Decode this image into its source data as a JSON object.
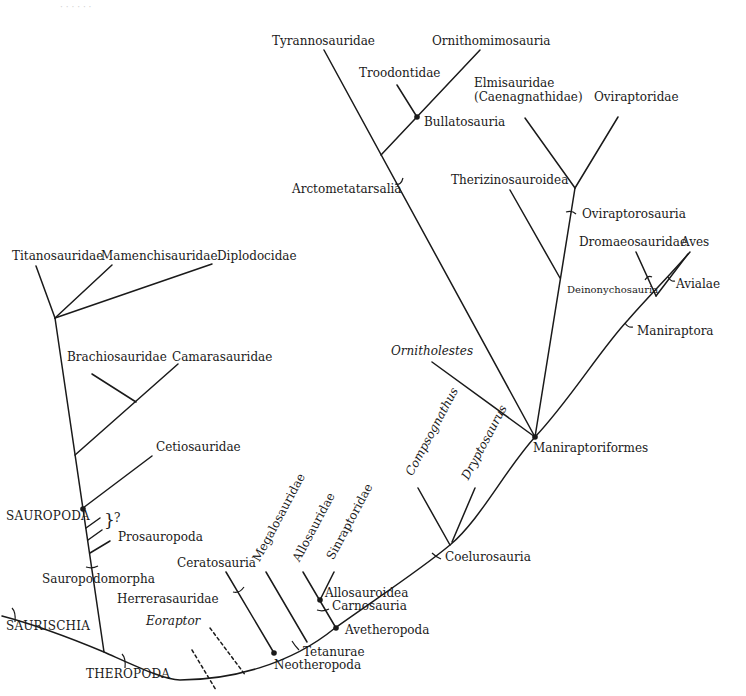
{
  "diagram": {
    "type": "cladogram",
    "colors": {
      "line": "#1a1a1a",
      "background": "#ffffff",
      "text": "#1a1a1a"
    }
  },
  "labels": {
    "saurischia": "SAURISCHIA",
    "theropoda": "THEROPODA",
    "sauropodomorpha": "Sauropodomorpha",
    "sauropoda": "SAUROPODA",
    "prosauropoda": "Prosauropoda",
    "question": "?",
    "cetiosauridae": "Cetiosauridae",
    "brachiosauridae": "Brachiosauridae",
    "camarasauridae": "Camarasauridae",
    "titanosauridae": "Titanosauridae",
    "mamenchisauridae": "Mamenchisauridae",
    "diplodocidae": "Diplodocidae",
    "herrerasauridae": "Herrerasauridae",
    "eoraptor": "Eoraptor",
    "ceratosauria": "Ceratosauria",
    "megalosauridae": "Megalosauridae",
    "allosauridae": "Allosauridae",
    "sinraptoridae": "Sinraptoridae",
    "allosauroidea": "Allosauroidea",
    "carnosauria": "Carnosauria",
    "avetheropoda": "Avetheropoda",
    "tetanurae": "Tetanurae",
    "neotheropoda": "Neotheropoda",
    "coelurosauria": "Coelurosauria",
    "compsognathus": "Compsognathus",
    "dryptosaurus": "Dryptosaurus",
    "ornitholestes": "Ornitholestes",
    "maniraptoriformes": "Maniraptoriformes",
    "tyrannosauridae": "Tyrannosauridae",
    "ornithomimosauria": "Ornithomimosauria",
    "troodontidae": "Troodontidae",
    "bullatosauria": "Bullatosauria",
    "arctometatarsalia": "Arctometatarsalia",
    "elmisauridae_1": "Elmisauridae",
    "elmisauridae_2": "(Caenagnathidae)",
    "oviraptoridae": "Oviraptoridae",
    "therizinosauroidea": "Therizinosauroidea",
    "oviraptorosauria": "Oviraptorosauria",
    "dromaeosauridae": "Dromaeosauridae",
    "aves": "Aves",
    "deinonychosauria": "Deinonychosauria",
    "avialae": "Avialae",
    "maniraptora": "Maniraptora"
  },
  "node_markers": [
    "Sauropoda",
    "Bullatosauria",
    "Maniraptoriformes",
    "Allosauroidea",
    "Avetheropoda",
    "Neotheropoda"
  ],
  "stem_markers": [
    "Saurischia",
    "Theropoda",
    "Sauropodomorpha",
    "Ceratosauria",
    "Tetanurae",
    "Carnosauria",
    "Coelurosauria",
    "Arctometatarsalia",
    "Oviraptorosauria",
    "Deinonychosauria",
    "Avialae",
    "Maniraptora"
  ]
}
